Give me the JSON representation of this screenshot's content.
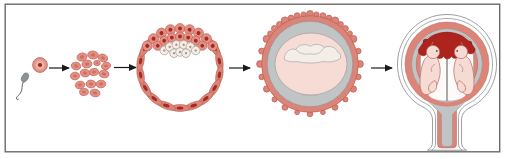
{
  "diagram": {
    "type": "embryonic-development-sequence",
    "stage_count": 5,
    "arrow_count": 4,
    "stages": [
      {
        "id": 1,
        "icon": "sperm-and-fertilized-egg-icon"
      },
      {
        "id": 2,
        "icon": "morula-cell-cluster-icon"
      },
      {
        "id": 3,
        "icon": "blastocyst-icon"
      },
      {
        "id": 4,
        "icon": "implanted-embryo-with-villi-icon"
      },
      {
        "id": 5,
        "icon": "twin-fetuses-in-uterus-icon"
      }
    ]
  },
  "colors": {
    "frame": "#6a6a6a",
    "arrow_black": "#1a1a1a",
    "salmon": "#dd8478",
    "salmon_dark": "#b85c50",
    "cell_fill": "#e59084",
    "cell_outline": "#bf6257",
    "cell_core": "#d0715f",
    "nucleus_red": "#a12c23",
    "dark_red": "#ad231e",
    "gray_fill": "#c0c4c5",
    "light_pink": "#f7dcd6",
    "white_warm": "#f3efe8",
    "sac_white": "#fdfbf9",
    "sperm_gray": "#8d9296",
    "outline_gray": "#9aa0a2",
    "fetus_fill": "#f6dbd5",
    "fetus_outline": "#bd7567",
    "egg_outer": "#e2968a",
    "egg_inner": "#efb3a6",
    "egg_core": "#9c2b24"
  }
}
